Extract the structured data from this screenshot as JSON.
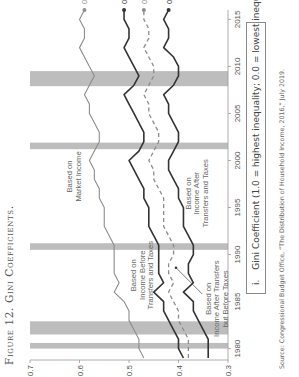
{
  "figure": {
    "title": "Figure 12. Gini Coefficients.",
    "legend_note_number": "i.",
    "legend_note": "Gini Coefficient (1.0 = highest inequality; 0.0 = lowest inequality)",
    "source": "Source: Congressional Budget Office, “The Distribution of Household Income, 2016,” July 2019."
  },
  "chart_data": {
    "type": "line",
    "title": "Figure 12. Gini Coefficients.",
    "xlabel": "",
    "ylabel": "Gini Coefficient (1.0 = highest inequality; 0.0 = lowest inequality)",
    "xlim": [
      1979,
      2016
    ],
    "ylim": [
      0.3,
      0.7
    ],
    "x_ticks": [
      "1980",
      "1985",
      "1990",
      "1995",
      "2000",
      "2005",
      "2010",
      "2015"
    ],
    "y_ticks": [
      "0.3",
      "0.4",
      "0.5",
      "0.6",
      "0.7"
    ],
    "grid": false,
    "recession_bands": [
      [
        1980.0,
        1980.6
      ],
      [
        1981.5,
        1982.9
      ],
      [
        1990.5,
        1991.2
      ],
      [
        2001.2,
        2001.9
      ],
      [
        2007.9,
        2009.5
      ]
    ],
    "x": [
      1979,
      1980,
      1981,
      1982,
      1983,
      1984,
      1985,
      1986,
      1987,
      1988,
      1989,
      1990,
      1991,
      1992,
      1993,
      1994,
      1995,
      1996,
      1997,
      1998,
      1999,
      2000,
      2001,
      2002,
      2003,
      2004,
      2005,
      2006,
      2007,
      2008,
      2009,
      2010,
      2011,
      2012,
      2013,
      2014,
      2015,
      2016
    ],
    "series": [
      {
        "name": "Based on Market Income",
        "style": "solid-gray",
        "values": [
          0.47,
          0.48,
          0.48,
          0.49,
          0.5,
          0.5,
          0.51,
          0.53,
          0.52,
          0.53,
          0.53,
          0.53,
          0.53,
          0.54,
          0.55,
          0.55,
          0.55,
          0.56,
          0.56,
          0.57,
          0.57,
          0.58,
          0.57,
          0.56,
          0.56,
          0.57,
          0.58,
          0.58,
          0.59,
          0.58,
          0.57,
          0.58,
          0.59,
          0.6,
          0.59,
          0.59,
          0.6,
          0.59
        ]
      },
      {
        "name": "Based on Income Before Transfers and Taxes",
        "style": "solid-dark",
        "end_label": "0.51",
        "values": [
          0.39,
          0.4,
          0.4,
          0.41,
          0.42,
          0.43,
          0.43,
          0.45,
          0.43,
          0.44,
          0.44,
          0.44,
          0.44,
          0.45,
          0.46,
          0.46,
          0.46,
          0.47,
          0.47,
          0.48,
          0.49,
          0.5,
          0.48,
          0.47,
          0.47,
          0.48,
          0.49,
          0.5,
          0.51,
          0.49,
          0.48,
          0.49,
          0.5,
          0.51,
          0.5,
          0.5,
          0.51,
          0.51
        ]
      },
      {
        "name": "Based on Income After Transfers but Before Taxes",
        "style": "dashed-gray",
        "end_label": "0.47",
        "values": [
          0.38,
          0.38,
          0.38,
          0.39,
          0.4,
          0.4,
          0.41,
          0.42,
          0.41,
          0.42,
          0.42,
          0.41,
          0.41,
          0.42,
          0.43,
          0.43,
          0.43,
          0.43,
          0.44,
          0.45,
          0.45,
          0.46,
          0.45,
          0.44,
          0.44,
          0.45,
          0.46,
          0.46,
          0.47,
          0.46,
          0.45,
          0.45,
          0.46,
          0.47,
          0.46,
          0.46,
          0.47,
          0.47
        ]
      },
      {
        "name": "Based on Income After Transfers and Taxes",
        "style": "solid-dark",
        "end_label": "0.42",
        "values": [
          0.34,
          0.34,
          0.34,
          0.35,
          0.36,
          0.37,
          0.37,
          0.39,
          0.37,
          0.38,
          0.38,
          0.37,
          0.37,
          0.38,
          0.39,
          0.39,
          0.39,
          0.4,
          0.4,
          0.41,
          0.42,
          0.42,
          0.41,
          0.4,
          0.4,
          0.41,
          0.42,
          0.42,
          0.43,
          0.41,
          0.4,
          0.4,
          0.41,
          0.43,
          0.42,
          0.42,
          0.43,
          0.42
        ]
      }
    ],
    "end_labels": {
      "market": "0.59",
      "before": "0.51",
      "after_transfers": "0.47",
      "after_taxes": "0.42"
    },
    "annotations": {
      "market": [
        "Based on",
        "Market Income"
      ],
      "before": [
        "Based on",
        "Income Before",
        "Transfers and Taxes"
      ],
      "after_transfers": [
        "Based on",
        "Income After Transfers",
        "but Before Taxes"
      ],
      "after_taxes": [
        "Based on",
        "Income After",
        "Transfers and Taxes"
      ]
    },
    "colors": {
      "market": "#8c8c8c",
      "before": "#3a3a3a",
      "after_transfers": "#8c8c8c",
      "after_taxes": "#3a3a3a",
      "band": "#bdbdbd"
    }
  }
}
